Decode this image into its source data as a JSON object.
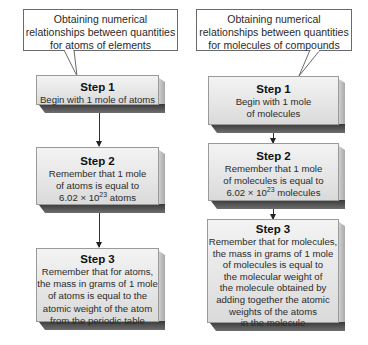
{
  "left_column": {
    "callout": {
      "lines": [
        "Obtaining numerical",
        "relationships between quantities",
        "for atoms of elements"
      ]
    },
    "steps": [
      {
        "title": "Step 1",
        "lines": [
          "Begin with 1 mole of atoms"
        ]
      },
      {
        "title": "Step 2",
        "lines": [
          "Remember that 1 mole",
          "of atoms is equal to"
        ],
        "exp_line": {
          "base": "6.02 × 10",
          "exp": "23",
          "suffix": " atoms"
        }
      },
      {
        "title": "Step 3",
        "lines": [
          "Remember that for atoms,",
          "the mass in grams of 1 mole",
          "of atoms is equal to the",
          "atomic weight of the atom",
          "from the periodic table"
        ]
      }
    ]
  },
  "right_column": {
    "callout": {
      "lines": [
        "Obtaining numerical",
        "relationships between quantities",
        "for molecules of compounds"
      ]
    },
    "steps": [
      {
        "title": "Step 1",
        "lines": [
          "Begin with 1 mole",
          "of molecules"
        ]
      },
      {
        "title": "Step 2",
        "lines": [
          "Remember that 1 mole",
          "of molecules is equal to"
        ],
        "exp_line": {
          "base": "6.02 × 10",
          "exp": "23",
          "suffix": " molecules"
        }
      },
      {
        "title": "Step 3",
        "lines": [
          "Remember that for molecules,",
          "the mass in grams of 1 mole",
          "of molecules is equal to",
          "the molecular weight of",
          "the molecule obtained by",
          "adding together the atomic",
          "weights of the atoms",
          "in the molecule"
        ]
      }
    ]
  },
  "colors": {
    "box_fill_top": "#f3f3f3",
    "box_fill_bottom": "#dadada",
    "box_shadow": "#3a3a3a",
    "callout_border": "#6a6a6a"
  }
}
